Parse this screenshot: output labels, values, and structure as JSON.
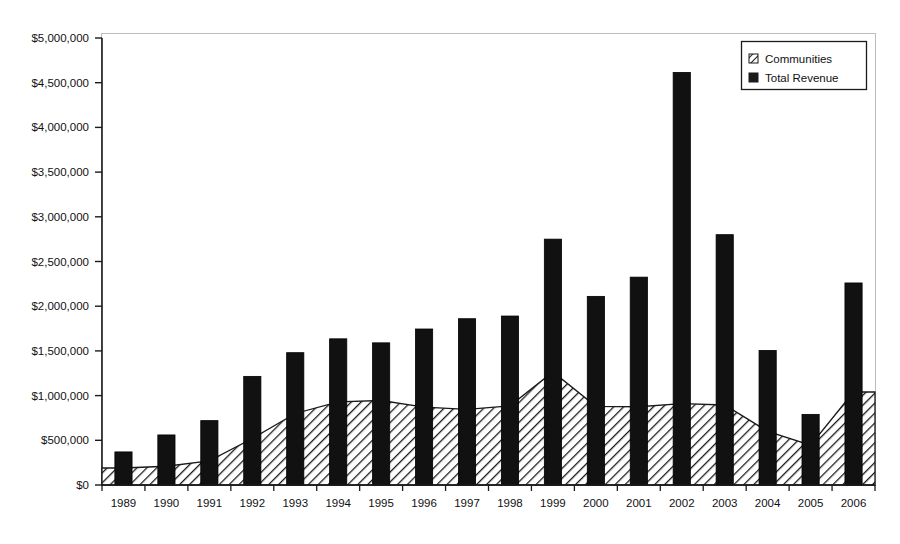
{
  "chart_data": {
    "type": "bar",
    "title": "",
    "subtitle": "",
    "xlabel": "",
    "ylabel": "",
    "categories": [
      "1989",
      "1990",
      "1991",
      "1992",
      "1993",
      "1994",
      "1995",
      "1996",
      "1997",
      "1998",
      "1999",
      "2000",
      "2001",
      "2002",
      "2003",
      "2004",
      "2005",
      "2006"
    ],
    "series": [
      {
        "name": "Communities",
        "render": "area",
        "pattern": "diagonal-hatch",
        "color": "#000000",
        "values": [
          190000,
          210000,
          270000,
          520000,
          800000,
          930000,
          945000,
          870000,
          845000,
          885000,
          1265000,
          880000,
          875000,
          910000,
          895000,
          600000,
          445000,
          1040000
        ]
      },
      {
        "name": "Total Revenue",
        "render": "bar",
        "pattern": "solid",
        "color": "#000000",
        "values": [
          370000,
          560000,
          720000,
          1215000,
          1480000,
          1635000,
          1590000,
          1745000,
          1860000,
          1890000,
          2750000,
          2110000,
          2325000,
          4615000,
          2800000,
          1505000,
          790000,
          2260000
        ]
      }
    ],
    "ylim": [
      0,
      5000000
    ],
    "ytick_values": [
      0,
      500000,
      1000000,
      1500000,
      2000000,
      2500000,
      3000000,
      3500000,
      4000000,
      4500000,
      5000000
    ],
    "ytick_labels": [
      "$0",
      "$500,000",
      "$1,000,000",
      "$1,500,000",
      "$2,000,000",
      "$2,500,000",
      "$3,000,000",
      "$3,500,000",
      "$4,000,000",
      "$4,500,000",
      "$5,000,000"
    ],
    "grid": false,
    "legend": {
      "position": "top-right",
      "entries": [
        {
          "label": "Communities",
          "swatch": "hatch"
        },
        {
          "label": "Total Revenue",
          "swatch": "solid"
        }
      ]
    },
    "plot_frame_color": "#b9b9b9",
    "axis_color": "#1a1a1a"
  }
}
